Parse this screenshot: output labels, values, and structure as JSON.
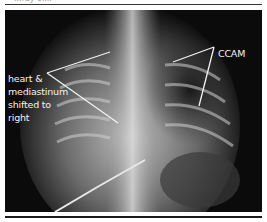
{
  "figure": {
    "caption_fragment": "...ray of...",
    "image_description": "Chest X-ray (frontal view)",
    "annotations": [
      {
        "id": "heart",
        "lines": [
          "heart &",
          "mediastinum",
          "shifted to",
          "right"
        ]
      },
      {
        "id": "ccam",
        "lines": [
          "CCAM"
        ]
      }
    ],
    "colors": {
      "background": "#0b0b0b",
      "annotation": "#f2f2f2",
      "rule": "#1a1a1a"
    }
  }
}
